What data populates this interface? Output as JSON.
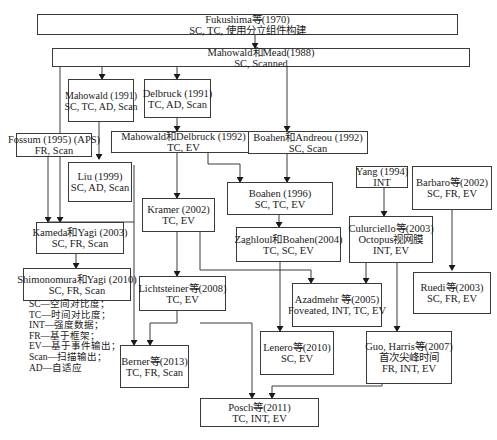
{
  "nodes": {
    "fukushima": {
      "title": "Fukushima等(1970)",
      "sub": "SC, TC, 使用分立组件构建"
    },
    "mahowald_mead": {
      "title": "Mahowald和Mead(1988)",
      "sub": "SC, Scanned"
    },
    "mahowald1991": {
      "title": "Mahowald (1991)",
      "sub": "SC, TC, AD, Scan"
    },
    "delbruck1991": {
      "title": "Delbruck (1991)",
      "sub": "TC, AD, Scan"
    },
    "fossum": {
      "title": "Fossum (1995) (APS)",
      "sub": "FR, Scan"
    },
    "liu": {
      "title": "Liu (1999)",
      "sub": "SC, AD, Scan"
    },
    "mahowald_delbruck": {
      "title": "Mahowald和Delbruck (1992)",
      "sub": "TC, EV"
    },
    "boahen_andreou": {
      "title": "Boahen和Andreou (1992)",
      "sub": "SC, Scan"
    },
    "yang": {
      "title": "Yang (1994)",
      "sub": "INT"
    },
    "barbaro": {
      "title": "Barbaro等(2002)",
      "sub": "SC, FR, EV"
    },
    "boahen1996": {
      "title": "Boahen (1996)",
      "sub": "SC, TC, EV"
    },
    "kramer": {
      "title": "Kramer (2002)",
      "sub": "TC, EV"
    },
    "kameda_yagi": {
      "title": "Kameda和Yagi (2003)",
      "sub": "SC, FR, Scan"
    },
    "zaghloul_boahen": {
      "title": "Zaghloul和Boahen(2004)",
      "sub": "TC, SC, EV"
    },
    "culurciello": {
      "title": "Culurciello等(2003)",
      "sub": "Octopus视网膜",
      "sub2": "INT, EV"
    },
    "shimonomura_yagi": {
      "title": "Shimonomura和Yagi (2010)",
      "sub": "SC, FR, Scan"
    },
    "ruedi": {
      "title": "Ruedi等(2003)",
      "sub": "SC, FR, EV"
    },
    "lichtsteiner": {
      "title": "Lichtsteiner等(2008)",
      "sub": "TC, EV"
    },
    "azadmehr": {
      "title": "Azadmehr 等(2005)",
      "sub": "Foveated, INT, TC, EV"
    },
    "lenero": {
      "title": "Lenero等(2010)",
      "sub": "SC, EV"
    },
    "guo_harris": {
      "title": "Guo, Harris等(2007)",
      "sub": "首次尖峰时间",
      "sub2": "FR, INT, EV"
    },
    "berner": {
      "title": "Berner等(2013)",
      "sub": "TC, FR, Scan"
    },
    "posch": {
      "title": "Posch等(2011)",
      "sub": "TC, INT, EV"
    }
  },
  "legend": [
    "SC—空间对比度；",
    "TC—时间对比度；",
    "INT—强度数据；",
    "FR—基于框架；",
    "EV—基于事件输出；",
    "Scan—扫描输出；",
    "AD—自适应"
  ],
  "edges": [
    [
      "fukushima",
      "mahowald_mead"
    ],
    [
      "mahowald_mead",
      "mahowald1991"
    ],
    [
      "mahowald_mead",
      "delbruck1991"
    ],
    [
      "mahowald_mead",
      "boahen_andreou"
    ],
    [
      "mahowald_mead",
      "kameda_yagi"
    ],
    [
      "mahowald1991",
      "liu"
    ],
    [
      "fossum",
      "kameda_yagi"
    ],
    [
      "delbruck1991",
      "mahowald_delbruck"
    ],
    [
      "mahowald_delbruck",
      "kramer"
    ],
    [
      "mahowald_delbruck",
      "boahen1996"
    ],
    [
      "boahen_andreou",
      "boahen1996"
    ],
    [
      "boahen1996",
      "zaghloul_boahen"
    ],
    [
      "kameda_yagi",
      "shimonomura_yagi"
    ],
    [
      "kramer",
      "lichtsteiner"
    ],
    [
      "kramer",
      "azadmehr"
    ],
    [
      "zaghloul_boahen",
      "lenero"
    ],
    [
      "yang",
      "culurciello"
    ],
    [
      "culurciello",
      "azadmehr"
    ],
    [
      "culurciello",
      "guo_harris"
    ],
    [
      "barbaro",
      "ruedi"
    ],
    [
      "lichtsteiner",
      "berner"
    ],
    [
      "lichtsteiner",
      "posch"
    ],
    [
      "liu",
      "berner"
    ],
    [
      "guo_harris",
      "posch"
    ]
  ]
}
